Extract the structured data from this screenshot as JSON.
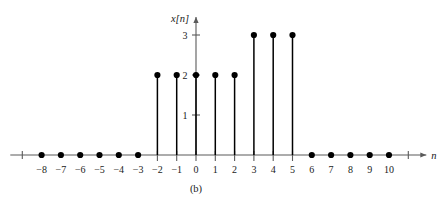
{
  "figure": {
    "caption": "(b)",
    "background_color": "#ffffff",
    "axis_color": "#5a5a5a",
    "stem_color": "#000000"
  },
  "chart_data": {
    "type": "stem",
    "title": "",
    "subtitle": "",
    "xlabel": "n",
    "ylabel": "x[n]",
    "grid": false,
    "legend": null,
    "xlim": [
      -9,
      11
    ],
    "ylim": [
      0,
      3
    ],
    "x": [
      -8,
      -7,
      -6,
      -5,
      -4,
      -3,
      -2,
      -1,
      0,
      1,
      2,
      3,
      4,
      5,
      6,
      7,
      8,
      9,
      10
    ],
    "values": [
      0,
      0,
      0,
      0,
      0,
      0,
      2,
      2,
      2,
      2,
      2,
      3,
      3,
      3,
      0,
      0,
      0,
      0,
      0
    ],
    "xticklabels": [
      "-8",
      "-7",
      "-6",
      "-5",
      "-4",
      "-3",
      "-2",
      "-1",
      "0",
      "1",
      "2",
      "3",
      "4",
      "5",
      "6",
      "7",
      "8",
      "9",
      "10"
    ],
    "yticks": [
      1,
      2,
      3
    ],
    "yticklabels": [
      "1",
      "2",
      "3"
    ],
    "unlabeled_xticks": [
      -9,
      11
    ],
    "annotations": []
  }
}
